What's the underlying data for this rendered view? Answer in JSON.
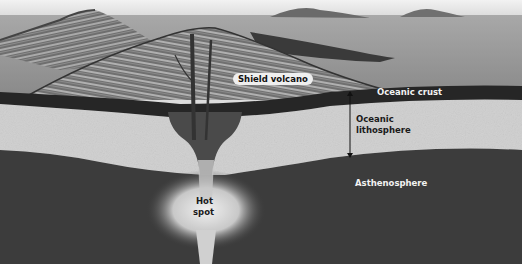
{
  "diagram": {
    "labels": {
      "shield_volcano": "Shield volcano",
      "oceanic_crust": "Oceanic crust",
      "oceanic_lithosphere_line1": "Oceanic",
      "oceanic_lithosphere_line2": "lithosphere",
      "asthenosphere": "Asthenosphere",
      "hot_spot_line1": "Hot",
      "hot_spot_line2": "spot"
    },
    "colors": {
      "sky": "#e6e6e6",
      "sea": "#9c9c9c",
      "volcano": "#7a7a7a",
      "crust": "#2a2a2a",
      "lithosphere": "#cfcfcf",
      "asthenosphere": "#3c3c3c",
      "plume": "#d8d8d8"
    }
  }
}
